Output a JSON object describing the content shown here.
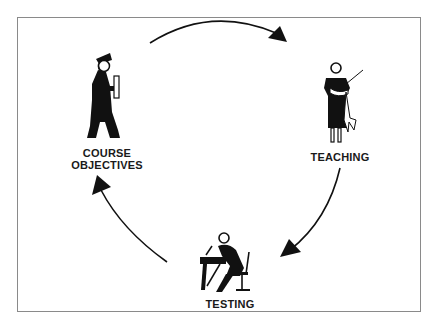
{
  "diagram": {
    "type": "cycle",
    "nodes": [
      {
        "id": "course_objectives",
        "label_line1": "COURSE",
        "label_line2": "OBJECTIVES",
        "icon": "graduate-figure-icon"
      },
      {
        "id": "teaching",
        "label": "TEACHING",
        "icon": "teacher-with-pointer-icon"
      },
      {
        "id": "testing",
        "label": "TESTING",
        "icon": "student-writing-at-desk-icon"
      }
    ],
    "edges": [
      {
        "from": "course_objectives",
        "to": "teaching"
      },
      {
        "from": "teaching",
        "to": "testing"
      },
      {
        "from": "testing",
        "to": "course_objectives"
      }
    ],
    "colors": {
      "ink": "#111111",
      "frame": "#8a8a8a",
      "background": "#ffffff"
    }
  }
}
